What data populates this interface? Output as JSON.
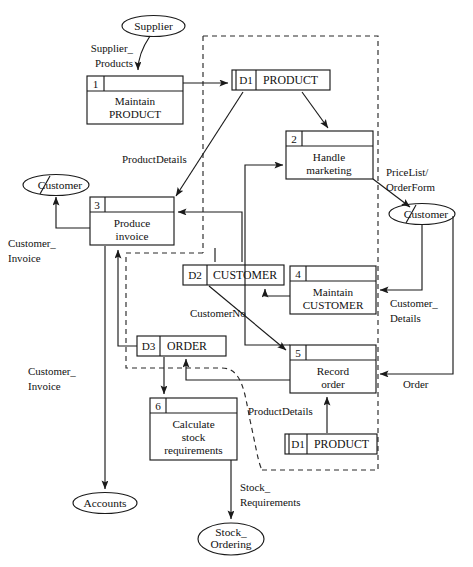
{
  "diagram": {
    "type": "data-flow-diagram",
    "notation": "Yourdon/Gane-Sarson style DFD with system boundary",
    "entities": [
      {
        "id": "ent-supplier",
        "label": "Supplier",
        "duplicate_marker": false
      },
      {
        "id": "ent-customer-left",
        "label": "Customer",
        "duplicate_marker": true
      },
      {
        "id": "ent-customer-right",
        "label": "Customer",
        "duplicate_marker": true
      },
      {
        "id": "ent-accounts",
        "label": "Accounts",
        "duplicate_marker": false
      },
      {
        "id": "ent-stock-ordering",
        "label_line1": "Stock_",
        "label_line2": "Ordering",
        "duplicate_marker": false
      }
    ],
    "processes": [
      {
        "id": "proc-1",
        "number": "1",
        "line1": "Maintain",
        "line2": "PRODUCT",
        "line3": ""
      },
      {
        "id": "proc-2",
        "number": "2",
        "line1": "Handle",
        "line2": "marketing",
        "line3": ""
      },
      {
        "id": "proc-3",
        "number": "3",
        "line1": "Produce",
        "line2": "invoice",
        "line3": ""
      },
      {
        "id": "proc-4",
        "number": "4",
        "line1": "Maintain",
        "line2": "CUSTOMER",
        "line3": ""
      },
      {
        "id": "proc-5",
        "number": "5",
        "line1": "Record",
        "line2": "order",
        "line3": ""
      },
      {
        "id": "proc-6",
        "number": "6",
        "line1": "Calculate",
        "line2": "stock",
        "line3": "requirements"
      }
    ],
    "datastores": [
      {
        "id": "store-d1-top",
        "ref": "D1",
        "label": "PRODUCT"
      },
      {
        "id": "store-d2",
        "ref": "D2",
        "label": "CUSTOMER"
      },
      {
        "id": "store-d3",
        "ref": "D3",
        "label": "ORDER"
      },
      {
        "id": "store-d1-bottom",
        "ref": "D1",
        "label": "PRODUCT"
      }
    ],
    "flows": [
      {
        "id": "flow-supplier-products",
        "line1": "Supplier_",
        "line2": "Products",
        "from": "Supplier",
        "to": "Maintain PRODUCT"
      },
      {
        "id": "flow-productdetails-top",
        "line1": "ProductDetails",
        "line2": "",
        "from": "D1 PRODUCT",
        "to": "Produce invoice"
      },
      {
        "id": "flow-pricelist-orderform",
        "line1": "PriceList/",
        "line2": "OrderForm",
        "from": "Handle marketing",
        "to": "Customer"
      },
      {
        "id": "flow-customer-invoice-top",
        "line1": "Customer_",
        "line2": "Invoice",
        "from": "Produce invoice",
        "to": "Customer"
      },
      {
        "id": "flow-customerno",
        "line1": "CustomerNo",
        "line2": "",
        "from": "D2 CUSTOMER",
        "to": "Record order"
      },
      {
        "id": "flow-customer-details",
        "line1": "Customer_",
        "line2": "Details",
        "from": "Customer",
        "to": "Maintain CUSTOMER"
      },
      {
        "id": "flow-order",
        "line1": "Order",
        "line2": "",
        "from": "Customer",
        "to": "Record order"
      },
      {
        "id": "flow-customer-invoice-bottom",
        "line1": "Customer_",
        "line2": "Invoice",
        "from": "Produce invoice",
        "to": "Accounts"
      },
      {
        "id": "flow-productdetails-bottom",
        "line1": "ProductDetails",
        "line2": "",
        "from": "D1 PRODUCT",
        "to": "Record order"
      },
      {
        "id": "flow-stock-requirements",
        "line1": "Stock_",
        "line2": "Requirements",
        "from": "Calculate stock requirements",
        "to": "Stock_Ordering"
      }
    ],
    "colors": {
      "line": "#1a1a1a",
      "boundary": "#2a2a2a",
      "background": "#ffffff",
      "text": "#111111"
    }
  }
}
